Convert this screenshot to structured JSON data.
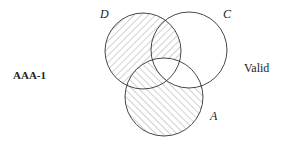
{
  "form": {
    "name": "AAA-1",
    "verdict": "Valid"
  },
  "sets": [
    {
      "name": "D",
      "cx": 143,
      "cy": 51,
      "r": 38,
      "hatch": "backslash"
    },
    {
      "name": "C",
      "cx": 189,
      "cy": 50,
      "r": 38,
      "hatch": "none"
    },
    {
      "name": "A",
      "cx": 164,
      "cy": 97,
      "r": 39,
      "hatch": "slash"
    }
  ],
  "labels": {
    "D": "D",
    "C": "C",
    "A": "A"
  },
  "shaded_regions": {
    "backslash_hatch": [
      "D only",
      "D∩C not A"
    ],
    "slash_hatch": [
      "A only",
      "A∩D not C"
    ],
    "unshaded": [
      "C only",
      "A∩C not D",
      "A∩C∩D"
    ]
  },
  "colors": {
    "stroke": "#333333",
    "hatch": "#8a8a8a"
  }
}
